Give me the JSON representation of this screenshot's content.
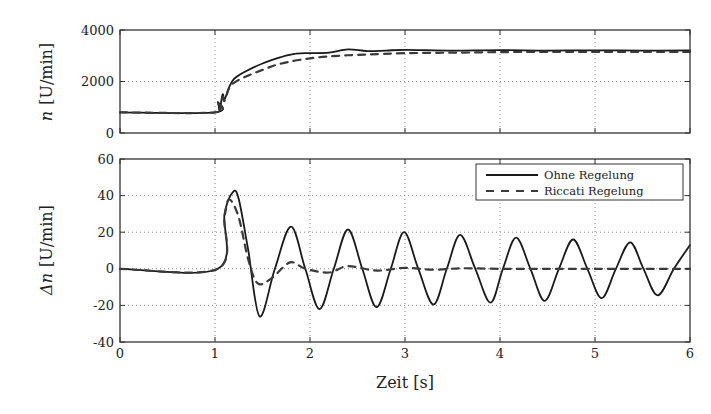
{
  "figure": {
    "xlabel": "Zeit [s]",
    "colors": {
      "line": "#1a1a1a",
      "dashed": "#3a3a3a",
      "grid": "#888888",
      "axes": "#333333"
    }
  },
  "chart_data": [
    {
      "type": "line",
      "title": "",
      "xlabel": "",
      "ylabel": "n [U/min]",
      "ylabel_symbol": "n",
      "ylabel_unit": "[U/min]",
      "xlim": [
        0,
        6
      ],
      "ylim": [
        0,
        4000
      ],
      "xticks": [
        0,
        1,
        2,
        3,
        4,
        5,
        6
      ],
      "xtick_labels_shown": false,
      "yticks": [
        0,
        2000,
        4000
      ],
      "ytick_labels": [
        "0",
        "2000",
        "4000"
      ],
      "grid": true,
      "legend": null,
      "series": [
        {
          "name": "Ohne Regelung",
          "style": "solid",
          "x": [
            0,
            1.0,
            1.03,
            1.05,
            1.08,
            1.1,
            1.15,
            1.2,
            1.3,
            1.5,
            1.7,
            1.85,
            2.0,
            2.2,
            2.4,
            2.6,
            2.8,
            3.0,
            3.5,
            4.0,
            4.5,
            5.0,
            5.5,
            6.0
          ],
          "values": [
            800,
            800,
            1200,
            900,
            1500,
            1300,
            1800,
            2100,
            2350,
            2700,
            2950,
            3080,
            3100,
            3120,
            3250,
            3180,
            3200,
            3230,
            3200,
            3220,
            3200,
            3210,
            3200,
            3210
          ]
        },
        {
          "name": "Riccati Regelung",
          "style": "dashed",
          "x": [
            0,
            1.0,
            1.03,
            1.05,
            1.08,
            1.1,
            1.15,
            1.2,
            1.3,
            1.5,
            1.7,
            2.0,
            2.3,
            2.6,
            3.0,
            3.5,
            4.0,
            4.5,
            5.0,
            5.5,
            6.0
          ],
          "values": [
            800,
            800,
            1150,
            900,
            1400,
            1250,
            1750,
            1950,
            2150,
            2450,
            2700,
            2900,
            3000,
            3050,
            3100,
            3120,
            3140,
            3150,
            3150,
            3150,
            3150
          ]
        }
      ]
    },
    {
      "type": "line",
      "title": "",
      "xlabel": "Zeit [s]",
      "ylabel": "Δn [U/min]",
      "ylabel_symbol": "Δn",
      "ylabel_unit": "[U/min]",
      "xlim": [
        0,
        6
      ],
      "ylim": [
        -40,
        60
      ],
      "xticks": [
        0,
        1,
        2,
        3,
        4,
        5,
        6
      ],
      "xtick_labels": [
        "0",
        "1",
        "2",
        "3",
        "4",
        "5",
        "6"
      ],
      "yticks": [
        -40,
        -20,
        0,
        20,
        40,
        60
      ],
      "ytick_labels": [
        "-40",
        "-20",
        "0",
        "20",
        "40",
        "60"
      ],
      "grid": true,
      "legend": {
        "position": "upper right",
        "entries": [
          "Ohne Regelung",
          "Riccati Regelung"
        ]
      },
      "series": [
        {
          "name": "Ohne Regelung",
          "style": "solid",
          "x": [
            0,
            1.03,
            1.1,
            1.19,
            1.25,
            1.35,
            1.47,
            1.63,
            1.8,
            1.95,
            2.1,
            2.25,
            2.4,
            2.55,
            2.7,
            2.85,
            2.99,
            3.14,
            3.3,
            3.44,
            3.58,
            3.74,
            3.9,
            4.03,
            4.17,
            4.32,
            4.47,
            4.62,
            4.77,
            4.92,
            5.07,
            5.22,
            5.37,
            5.51,
            5.66,
            5.83,
            6.0
          ],
          "values": [
            0,
            0,
            30,
            42,
            38,
            10,
            -26,
            0,
            23,
            0,
            -22,
            0,
            21.5,
            0,
            -21,
            0,
            20,
            0,
            -19.5,
            0,
            18.5,
            0,
            -18.5,
            0,
            17,
            0,
            -17.5,
            0,
            16,
            0,
            -16,
            0,
            14.5,
            0,
            -14.5,
            0,
            13
          ]
        },
        {
          "name": "Riccati Regelung",
          "style": "dashed",
          "x": [
            0,
            1.03,
            1.1,
            1.15,
            1.25,
            1.35,
            1.45,
            1.6,
            1.79,
            1.95,
            2.2,
            2.4,
            2.7,
            3.0,
            3.3,
            3.6,
            4.0,
            4.5,
            5.0,
            5.5,
            6.0
          ],
          "values": [
            0,
            0,
            28,
            38,
            28,
            5,
            -8,
            -5,
            3.5,
            0,
            -2,
            1.5,
            -1,
            0.5,
            -0.5,
            0.3,
            0,
            0,
            0,
            0,
            0
          ]
        }
      ]
    }
  ]
}
